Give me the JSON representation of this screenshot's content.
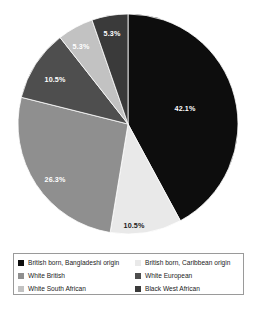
{
  "chart_data": {
    "type": "pie",
    "title": "",
    "subtitle": "",
    "xlabel": "",
    "ylabel": "",
    "legend_position": "bottom",
    "grid": false,
    "start_angle_deg": 0,
    "direction": "clockwise",
    "categories": [
      "British born, Bangladeshi origin",
      "British born, Caribbean origin",
      "White British",
      "White European",
      "White South African",
      "Black West African"
    ],
    "values": [
      42.1,
      10.5,
      26.3,
      10.5,
      5.3,
      5.3
    ],
    "value_labels": [
      "42.1%",
      "10.5%",
      "26.3%",
      "10.5%",
      "5.3%",
      "5.3%"
    ],
    "colors": [
      "#0d0d0d",
      "#e9e9e9",
      "#8f8f8f",
      "#4e4e4e",
      "#c2c2c2",
      "#3a3a3a"
    ],
    "label_colors": [
      "#ffffff",
      "#1a1a1a",
      "#ffffff",
      "#ffffff",
      "#ffffff",
      "#ffffff"
    ],
    "slices": [
      {
        "name": "British born, Bangladeshi origin",
        "value": 42.1,
        "label": "42.1%",
        "color": "#0d0d0d",
        "label_color": "#ffffff",
        "start_deg": 0,
        "end_deg": 151.56,
        "label_x": 185,
        "label_y": 109
      },
      {
        "name": "British born, Caribbean origin",
        "value": 10.5,
        "label": "10.5%",
        "color": "#e9e9e9",
        "label_color": "#1a1a1a",
        "start_deg": 151.56,
        "end_deg": 189.36,
        "label_x": 134,
        "label_y": 226
      },
      {
        "name": "White British",
        "value": 26.3,
        "label": "26.3%",
        "color": "#8f8f8f",
        "label_color": "#ffffff",
        "start_deg": 189.36,
        "end_deg": 284.04,
        "label_x": 55,
        "label_y": 180
      },
      {
        "name": "White European",
        "value": 10.5,
        "label": "10.5%",
        "color": "#4e4e4e",
        "label_color": "#ffffff",
        "start_deg": 284.04,
        "end_deg": 321.84,
        "label_x": 55,
        "label_y": 80
      },
      {
        "name": "White South African",
        "value": 5.3,
        "label": "5.3%",
        "color": "#c2c2c2",
        "label_color": "#ffffff",
        "start_deg": 321.84,
        "end_deg": 340.92,
        "label_x": 81,
        "label_y": 47
      },
      {
        "name": "Black West African",
        "value": 5.3,
        "label": "5.3%",
        "color": "#3a3a3a",
        "label_color": "#ffffff",
        "start_deg": 340.92,
        "end_deg": 360,
        "label_x": 112,
        "label_y": 34
      }
    ]
  },
  "legend": {
    "items": [
      {
        "label": "British born, Bangladeshi origin",
        "color": "#0d0d0d",
        "column": "left"
      },
      {
        "label": "British born, Caribbean origin",
        "color": "#e9e9e9",
        "column": "right"
      },
      {
        "label": "White British",
        "color": "#8f8f8f",
        "column": "left"
      },
      {
        "label": "White European",
        "color": "#4e4e4e",
        "column": "right"
      },
      {
        "label": "White South African",
        "color": "#c2c2c2",
        "column": "left"
      },
      {
        "label": "Black West African",
        "color": "#3a3a3a",
        "column": "right"
      }
    ]
  }
}
